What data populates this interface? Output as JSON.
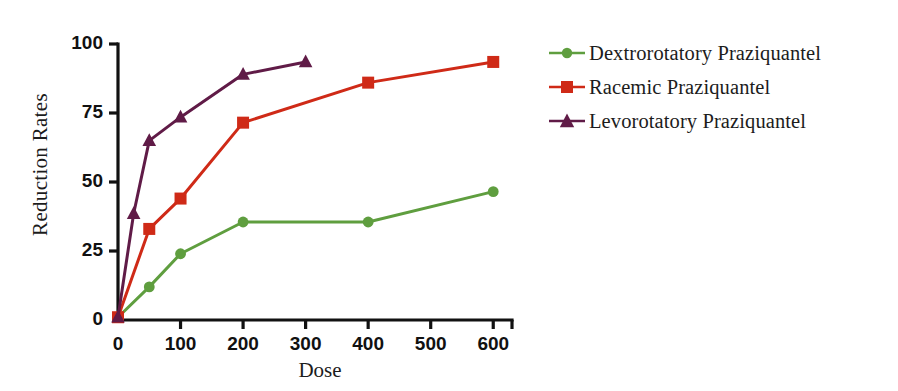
{
  "chart_data": {
    "type": "line",
    "title": "",
    "xlabel": "Dose",
    "ylabel": "Reduction Rates",
    "xlim": [
      0,
      630
    ],
    "ylim": [
      0,
      100
    ],
    "xticks": [
      0,
      100,
      200,
      300,
      400,
      500,
      600
    ],
    "xtick_labels": [
      "0",
      "100",
      "200",
      "300",
      "400",
      "500",
      "600"
    ],
    "yticks": [
      0,
      25,
      50,
      75,
      100
    ],
    "ytick_labels": [
      "0",
      "25",
      "50",
      "75",
      "100"
    ],
    "grid": false,
    "legend_position": "right",
    "series": [
      {
        "name": "Dextrorotatory Praziquantel",
        "color": "#5f9e3f",
        "marker": "circle",
        "x": [
          0,
          50,
          100,
          200,
          400,
          600
        ],
        "values": [
          1,
          12,
          24,
          35.5,
          35.5,
          46.5
        ]
      },
      {
        "name": "Racemic Praziquantel",
        "color": "#cf2a17",
        "marker": "square",
        "x": [
          0,
          50,
          100,
          200,
          400,
          600
        ],
        "values": [
          1,
          33,
          44,
          71.5,
          86,
          93.5
        ]
      },
      {
        "name": "Levorotatory Praziquantel",
        "color": "#601b47",
        "marker": "triangle",
        "x": [
          0,
          25,
          50,
          100,
          200,
          300
        ],
        "values": [
          1,
          38.5,
          65,
          73.5,
          89,
          93.5
        ]
      }
    ]
  },
  "axis": {
    "y_title": "Reduction Rates",
    "x_title": "Dose"
  },
  "legend": {
    "items": [
      {
        "label": "Dextrorotatory Praziquantel",
        "color": "#5f9e3f",
        "marker": "circle-marker"
      },
      {
        "label": "Racemic Praziquantel",
        "color": "#cf2a17",
        "marker": "square-marker"
      },
      {
        "label": "Levorotatory Praziquantel",
        "color": "#601b47",
        "marker": "triangle-marker"
      }
    ]
  },
  "colors": {
    "axis": "#111111",
    "background": "#ffffff",
    "green": "#5f9e3f",
    "red": "#cf2a17",
    "purple": "#601b47"
  }
}
